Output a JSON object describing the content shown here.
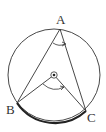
{
  "diagram": {
    "type": "inscribed-angle-theorem",
    "colors": {
      "stroke": "#333333",
      "background": "#ffffff"
    },
    "circle": {
      "cx": 54,
      "cy": 75,
      "r": 46
    },
    "center": {
      "name": "center-point",
      "x": 54,
      "y": 75
    },
    "points": {
      "A": {
        "label": "A",
        "x": 60,
        "y": 29
      },
      "B": {
        "label": "B",
        "x": 17,
        "y": 103
      },
      "C": {
        "label": "C",
        "x": 86,
        "y": 111
      }
    },
    "labels": {
      "A": "A",
      "B": "B",
      "C": "C"
    },
    "highlighted_arc": "BC",
    "angles": [
      {
        "vertex": "A",
        "between": [
          "B",
          "C"
        ],
        "kind": "inscribed"
      },
      {
        "vertex": "O",
        "between": [
          "B",
          "C"
        ],
        "kind": "central"
      }
    ]
  }
}
